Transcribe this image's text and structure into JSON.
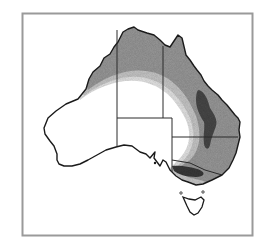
{
  "figure": {
    "type": "choropleth-map",
    "region": "Australia",
    "description": "Greyscale map of Australia with state borders; shaded zones in the north and east (densest along the Great Dividing Range in Queensland and Victoria), no text labels shown",
    "frame_color": "#9a9a9a",
    "outline_color": "#1a1a1a",
    "border_color": "#2a2a2a"
  },
  "zones": [
    {
      "id": "zone-1",
      "label": "lightest band",
      "color": "#e6e6e6"
    },
    {
      "id": "zone-2",
      "label": "light band",
      "color": "#c8c8c8"
    },
    {
      "id": "zone-3",
      "label": "medium band",
      "color": "#9a9a9a"
    },
    {
      "id": "zone-4",
      "label": "darkest core",
      "color": "#4a4a4a"
    }
  ]
}
